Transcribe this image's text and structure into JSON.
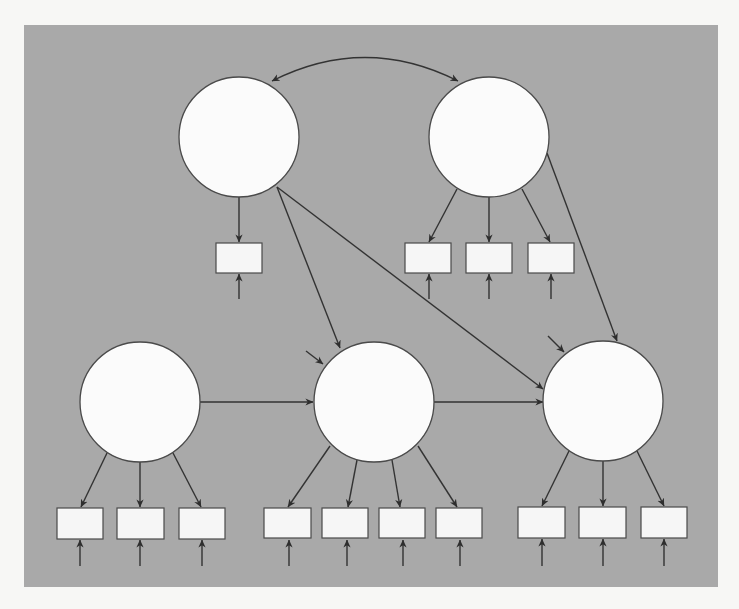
{
  "diagram": {
    "type": "structural-equation-model",
    "background_color": "#f7f7f5",
    "panel_color": "#a9a9a9",
    "panel": {
      "x": 24,
      "y": 25,
      "w": 694,
      "h": 562
    },
    "latent_radius": 60,
    "latents": [
      {
        "id": "L1",
        "cx": 239,
        "cy": 137
      },
      {
        "id": "L2",
        "cx": 489,
        "cy": 137
      },
      {
        "id": "L3",
        "cx": 140,
        "cy": 402
      },
      {
        "id": "L4",
        "cx": 374,
        "cy": 402
      },
      {
        "id": "L5",
        "cx": 603,
        "cy": 401
      }
    ],
    "observed": [
      {
        "id": "O1",
        "x": 216,
        "y": 243,
        "latent": "L1"
      },
      {
        "id": "O2",
        "x": 405,
        "y": 243,
        "latent": "L2"
      },
      {
        "id": "O3",
        "x": 466,
        "y": 243,
        "latent": "L2"
      },
      {
        "id": "O4",
        "x": 528,
        "y": 243,
        "latent": "L2"
      },
      {
        "id": "O5",
        "x": 57,
        "y": 508,
        "latent": "L3"
      },
      {
        "id": "O6",
        "x": 117,
        "y": 508,
        "latent": "L3"
      },
      {
        "id": "O7",
        "x": 179,
        "y": 508,
        "latent": "L3"
      },
      {
        "id": "O8",
        "x": 264,
        "y": 508,
        "latent": "L4"
      },
      {
        "id": "O9",
        "x": 322,
        "y": 508,
        "latent": "L4"
      },
      {
        "id": "O10",
        "x": 379,
        "y": 508,
        "latent": "L4"
      },
      {
        "id": "O11",
        "x": 436,
        "y": 508,
        "latent": "L4"
      },
      {
        "id": "O12",
        "x": 518,
        "y": 507,
        "latent": "L5"
      },
      {
        "id": "O13",
        "x": 579,
        "y": 507,
        "latent": "L5"
      },
      {
        "id": "O14",
        "x": 641,
        "y": 507,
        "latent": "L5"
      }
    ],
    "observed_size": {
      "w": 46,
      "h": 30
    },
    "structural_paths": [
      {
        "from": "L1",
        "to": "L4"
      },
      {
        "from": "L1",
        "to": "L5"
      },
      {
        "from": "L2",
        "to": "L5"
      },
      {
        "from": "L3",
        "to": "L4"
      },
      {
        "from": "L4",
        "to": "L5"
      }
    ],
    "covariances": [
      {
        "between": [
          "L1",
          "L2"
        ]
      }
    ],
    "disturbances": [
      "L4",
      "L5"
    ],
    "measurement_errors": "one per observed indicator",
    "labels": []
  }
}
